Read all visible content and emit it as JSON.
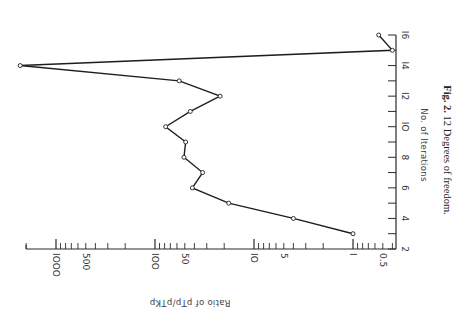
{
  "chart_data": {
    "type": "line",
    "orientation": "rotated-90-clockwise",
    "title": "",
    "caption": {
      "label": "Fig. 2.",
      "text": "12 Degrees of freedom."
    },
    "xlabel": "No. of Iterations",
    "ylabel": "Ratio of pTp/pTKp",
    "y_scale": "log",
    "xlim": [
      2,
      16
    ],
    "ylim": [
      0.37,
      3000
    ],
    "x_ticks": [
      "2",
      "4",
      "6",
      "8",
      "10",
      "12",
      "14",
      "16"
    ],
    "y_ticks": [
      "0.5",
      "1",
      "5",
      "10",
      "50",
      "100",
      "500",
      "1000"
    ],
    "grid": false,
    "x": [
      3,
      4,
      5,
      6,
      7,
      8,
      9,
      10,
      11,
      12,
      13,
      14,
      15,
      16
    ],
    "series": [
      {
        "name": "ratio",
        "values": [
          1,
          4,
          18,
          42,
          33,
          51,
          49,
          78,
          44,
          22,
          57,
          2300,
          0.4,
          0.55
        ]
      }
    ]
  },
  "labels": {
    "x_ticks": [
      "2",
      "4",
      "6",
      "8",
      "IO",
      "I2",
      "I4",
      "I6"
    ],
    "y_ticks": [
      "0.5",
      "I",
      "5",
      "IO",
      "50",
      "IOO",
      "500",
      "IOOO"
    ],
    "xlabel": "No. of Iterations",
    "ylabel": "Ratio of pTp/pTKp",
    "caption_label": "Fig. 2.",
    "caption_text": "12 Degrees of freedom."
  }
}
